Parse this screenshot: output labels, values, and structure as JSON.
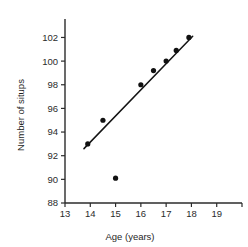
{
  "chart_data": {
    "type": "scatter",
    "title": "",
    "xlabel": "Age (years)",
    "ylabel": "Number of situps",
    "xlim": [
      13,
      20
    ],
    "ylim": [
      88,
      102.8
    ],
    "grid": false,
    "legend": null,
    "xticks": [
      13,
      14,
      15,
      16,
      17,
      18,
      19,
      20
    ],
    "xtick_labels": [
      "13",
      "14",
      "15",
      "16",
      "17",
      "18",
      "19",
      ""
    ],
    "yticks": [
      88,
      90,
      92,
      94,
      96,
      98,
      100,
      102
    ],
    "ytick_labels": [
      "88",
      "90",
      "92",
      "94",
      "96",
      "98",
      "100",
      "102"
    ],
    "points": [
      {
        "x": 13.9,
        "y": 93.0
      },
      {
        "x": 14.5,
        "y": 95.0
      },
      {
        "x": 15.0,
        "y": 90.1
      },
      {
        "x": 16.0,
        "y": 98.0
      },
      {
        "x": 16.5,
        "y": 99.2
      },
      {
        "x": 17.0,
        "y": 100.0
      },
      {
        "x": 17.4,
        "y": 100.9
      },
      {
        "x": 17.9,
        "y": 102.0
      }
    ],
    "series": [
      {
        "name": "Situps vs age",
        "x": [
          13.9,
          14.5,
          15.0,
          16.0,
          16.5,
          17.0,
          17.4,
          17.9
        ],
        "values": [
          93.0,
          95.0,
          90.1,
          98.0,
          99.2,
          100.0,
          100.9,
          102.0
        ]
      }
    ],
    "trend_line": {
      "type": "line-of-best-fit",
      "x_start": 13.75,
      "y_start": 92.6,
      "x_end": 18.05,
      "y_end": 102.1
    },
    "annotations": [],
    "colors": {
      "point": "#111111",
      "line": "#141414",
      "axis": "#2b2b2b",
      "text": "#1f1f1f",
      "background": "#ffffff"
    }
  }
}
